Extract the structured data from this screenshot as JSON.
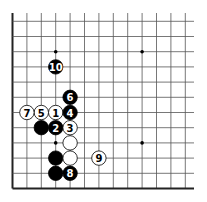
{
  "board": {
    "description": "Go board corner diagram (lower-left corner), moves 1-10",
    "columns": 13,
    "rows": 12,
    "origin_x": 12.5,
    "origin_y": 188.5,
    "spacing_x": 14.4,
    "spacing_y": 15.2,
    "top_extent_y": 13,
    "right_extent_x": 194,
    "line_color": "#555555",
    "edge_color": "#222222",
    "background": "#ffffff",
    "star_points": [
      {
        "col": 3,
        "row": 9
      },
      {
        "col": 9,
        "row": 9
      },
      {
        "col": 3,
        "row": 3
      },
      {
        "col": 9,
        "row": 3
      }
    ],
    "stones": [
      {
        "color": "white",
        "col": 3,
        "row": 5,
        "label": "1"
      },
      {
        "color": "black",
        "col": 3,
        "row": 4,
        "label": "2"
      },
      {
        "color": "white",
        "col": 4,
        "row": 4,
        "label": "3"
      },
      {
        "color": "black",
        "col": 4,
        "row": 5,
        "label": "4"
      },
      {
        "color": "white",
        "col": 2,
        "row": 5,
        "label": "5"
      },
      {
        "color": "black",
        "col": 4,
        "row": 6,
        "label": "6"
      },
      {
        "color": "white",
        "col": 1,
        "row": 5,
        "label": "7"
      },
      {
        "color": "black",
        "col": 4,
        "row": 1,
        "label": "8"
      },
      {
        "color": "white",
        "col": 6,
        "row": 2,
        "label": "9"
      },
      {
        "color": "black",
        "col": 3,
        "row": 8,
        "label": "10"
      },
      {
        "color": "black",
        "col": 2,
        "row": 4,
        "label": ""
      },
      {
        "color": "white",
        "col": 4,
        "row": 3,
        "label": ""
      },
      {
        "color": "black",
        "col": 3,
        "row": 2,
        "label": ""
      },
      {
        "color": "white",
        "col": 4,
        "row": 2,
        "label": ""
      },
      {
        "color": "black",
        "col": 3,
        "row": 1,
        "label": ""
      }
    ],
    "colors": {
      "black_stone": "#000000",
      "white_stone": "#ffffff",
      "black_label": "#ffffff",
      "white_label": "#000000"
    }
  }
}
